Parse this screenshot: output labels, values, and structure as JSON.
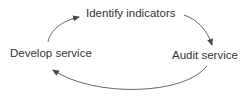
{
  "diagram": {
    "type": "cycle",
    "nodes": [
      {
        "id": "identify",
        "label": "Identify indicators"
      },
      {
        "id": "audit",
        "label": "Audit service"
      },
      {
        "id": "develop",
        "label": "Develop service"
      }
    ],
    "edges": [
      {
        "from": "identify",
        "to": "audit"
      },
      {
        "from": "audit",
        "to": "develop"
      },
      {
        "from": "develop",
        "to": "identify"
      }
    ],
    "colors": {
      "text": "#333333",
      "arrow": "#444444",
      "background": "#ffffff"
    }
  }
}
